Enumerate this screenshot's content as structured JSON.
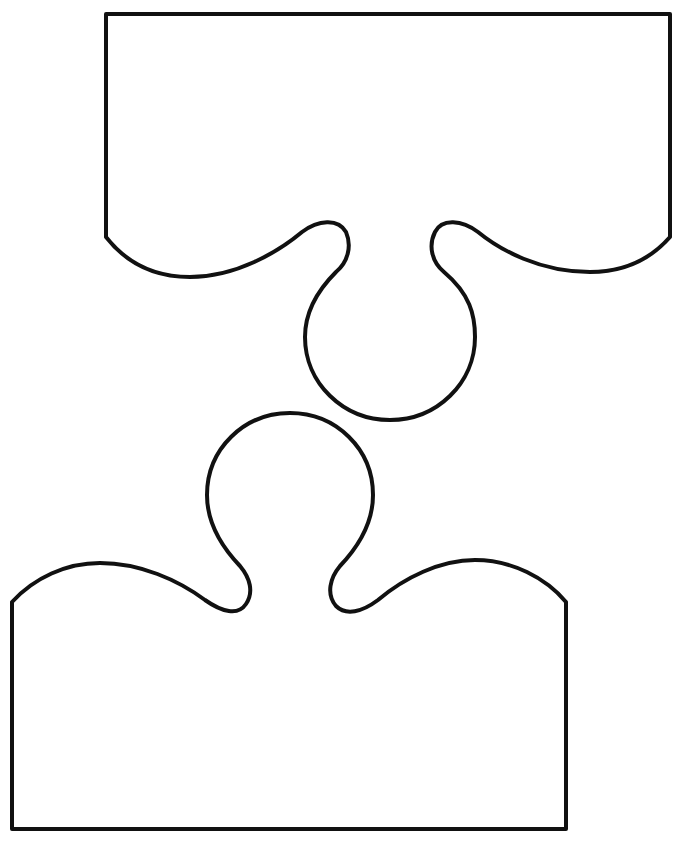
{
  "figure": {
    "background_color": "#ffffff",
    "stroke_color": "#111111",
    "pieces": [
      {
        "id": "top-piece",
        "label": "",
        "fill": "#ffffff",
        "path": "M 106 14 L 670 14 L 670 237 C 648 262 620 272 590 272 C 540 272 500 250 478 232 C 462 220 442 218 435 232 C 428 246 432 262 444 272 C 470 294 475 315 475 337 C 475 383 437 420 390 420 C 343 420 305 383 305 337 C 305 312 318 290 336 272 C 348 262 352 246 346 232 C 338 218 318 220 302 232 C 278 252 236 277 190 277 C 150 277 124 260 106 237 Z"
      },
      {
        "id": "bottom-piece",
        "label": "",
        "fill": "#ffffff",
        "path": "M 12 602 C 34 578 66 563 100 563 C 140 563 178 580 205 600 C 222 612 238 616 246 604 C 254 592 250 578 240 566 C 220 545 207 520 207 495 C 207 449 244 413 290 413 C 336 413 373 449 373 495 C 373 520 360 545 340 566 C 330 578 326 594 336 606 C 346 616 362 612 378 600 C 404 578 440 560 475 560 C 512 560 546 578 566 602 L 566 829 L 12 829 Z"
      }
    ]
  }
}
